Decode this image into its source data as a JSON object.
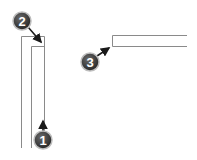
{
  "diagram": {
    "colors": {
      "line": "#8a8a8a",
      "badge": "#3a3a3a",
      "badge_ring": "#bdbdbd",
      "arrow": "#1a1a1a",
      "label": "#ffffff"
    },
    "callouts": [
      {
        "number": "1",
        "target": "inner-right-edge"
      },
      {
        "number": "2",
        "target": "inner-top-left-corner"
      },
      {
        "number": "3",
        "target": "horizontal-bar-corner"
      }
    ]
  }
}
